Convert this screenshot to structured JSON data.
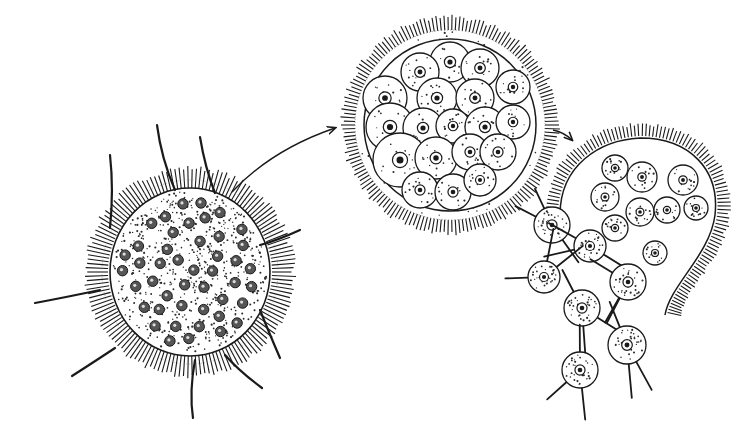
{
  "figure": {
    "width": 755,
    "height": 439,
    "background": "#ffffff",
    "ink": "#1a1a1a",
    "stipple": "#2b2b2b",
    "style": "pen-and-ink scientific illustration, no text labels"
  },
  "stages": [
    {
      "id": "stage-1-mature-cell",
      "cx": 190,
      "cy": 272,
      "rx": 80,
      "ry": 84,
      "cilia_outer_r": 104,
      "flagella": [
        {
          "x1": 175,
          "y1": 190,
          "x2": 157,
          "y2": 125
        },
        {
          "x1": 215,
          "y1": 193,
          "x2": 200,
          "y2": 137
        },
        {
          "x1": 110,
          "y1": 228,
          "x2": 110,
          "y2": 155
        },
        {
          "x1": 260,
          "y1": 245,
          "x2": 300,
          "y2": 230
        },
        {
          "x1": 100,
          "y1": 290,
          "x2": 35,
          "y2": 303
        },
        {
          "x1": 260,
          "y1": 310,
          "x2": 280,
          "y2": 358
        },
        {
          "x1": 115,
          "y1": 348,
          "x2": 72,
          "y2": 376
        },
        {
          "x1": 225,
          "y1": 355,
          "x2": 262,
          "y2": 388
        },
        {
          "x1": 195,
          "y1": 360,
          "x2": 193,
          "y2": 418
        }
      ],
      "nuclei_count": 45
    },
    {
      "id": "stage-2-encysted-cell",
      "cx": 450,
      "cy": 125,
      "r": 90,
      "cilia_outer_r": 108,
      "daughter_cells": [
        {
          "cx": 450,
          "cy": 62,
          "r": 20
        },
        {
          "cx": 420,
          "cy": 72,
          "r": 19
        },
        {
          "cx": 480,
          "cy": 68,
          "r": 19
        },
        {
          "cx": 385,
          "cy": 98,
          "r": 22
        },
        {
          "cx": 437,
          "cy": 98,
          "r": 20
        },
        {
          "cx": 475,
          "cy": 98,
          "r": 19
        },
        {
          "cx": 513,
          "cy": 87,
          "r": 17
        },
        {
          "cx": 390,
          "cy": 127,
          "r": 24
        },
        {
          "cx": 423,
          "cy": 128,
          "r": 20
        },
        {
          "cx": 453,
          "cy": 126,
          "r": 17
        },
        {
          "cx": 485,
          "cy": 127,
          "r": 20
        },
        {
          "cx": 513,
          "cy": 122,
          "r": 17
        },
        {
          "cx": 400,
          "cy": 160,
          "r": 27
        },
        {
          "cx": 436,
          "cy": 158,
          "r": 21
        },
        {
          "cx": 470,
          "cy": 152,
          "r": 18
        },
        {
          "cx": 498,
          "cy": 152,
          "r": 18
        },
        {
          "cx": 420,
          "cy": 190,
          "r": 18
        },
        {
          "cx": 453,
          "cy": 192,
          "r": 18
        },
        {
          "cx": 480,
          "cy": 180,
          "r": 16
        }
      ]
    },
    {
      "id": "stage-3-ruptured-cyst",
      "outline": "M 560,215 C 560,165 600,140 640,138 C 690,138 720,170 715,215 C 710,255 670,285 665,315",
      "free_cells_inside": [
        {
          "cx": 615,
          "cy": 168,
          "r": 13
        },
        {
          "cx": 642,
          "cy": 177,
          "r": 15
        },
        {
          "cx": 683,
          "cy": 180,
          "r": 15
        },
        {
          "cx": 605,
          "cy": 197,
          "r": 14
        },
        {
          "cx": 640,
          "cy": 212,
          "r": 14
        },
        {
          "cx": 667,
          "cy": 210,
          "r": 13
        },
        {
          "cx": 696,
          "cy": 208,
          "r": 12
        },
        {
          "cx": 615,
          "cy": 228,
          "r": 13
        },
        {
          "cx": 655,
          "cy": 253,
          "r": 12
        }
      ],
      "released_zoospores": [
        {
          "cx": 552,
          "cy": 225,
          "r": 18
        },
        {
          "cx": 590,
          "cy": 246,
          "r": 16
        },
        {
          "cx": 544,
          "cy": 277,
          "r": 16
        },
        {
          "cx": 628,
          "cy": 282,
          "r": 18
        },
        {
          "cx": 582,
          "cy": 308,
          "r": 18
        },
        {
          "cx": 627,
          "cy": 345,
          "r": 19
        },
        {
          "cx": 580,
          "cy": 370,
          "r": 18
        }
      ]
    }
  ],
  "arrows": [
    {
      "id": "arrow-1-to-2",
      "path": "M 232,192 C 262,160 300,140 335,128"
    },
    {
      "id": "arrow-2-to-3",
      "path": "M 553,130 C 562,132 568,136 572,140"
    }
  ]
}
